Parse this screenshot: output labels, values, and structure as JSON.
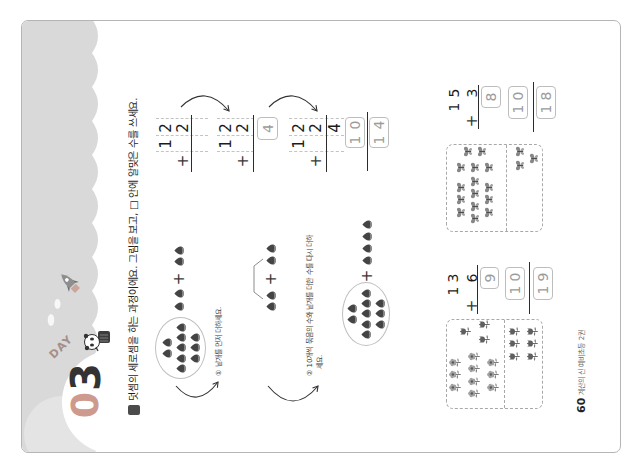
{
  "header": {
    "day_label": "DAY",
    "day_number_first": "0",
    "day_number_second": "3",
    "accent_color": "#cf9a8e",
    "band_color": "#d9d9d9",
    "decorations": [
      "rocket-icon",
      "cloud-icon",
      "astronaut-character"
    ]
  },
  "instruction": {
    "icon": "problem-marker-icon",
    "text": "덧셈의 세로셈을 하는 과정이에요. 그림을 보고, □ 안에 알맞은 수를 쓰세요."
  },
  "example": {
    "pictures": [
      {
        "bundle_rows": [
          2,
          5,
          3
        ],
        "left_count": 2,
        "operator": "+",
        "right_count": 2
      },
      {
        "left_count": 2,
        "operator": "+",
        "right_count": 2
      },
      {
        "bundle_rows": [
          2,
          5,
          3
        ],
        "operator": "+",
        "right_count": 4
      }
    ],
    "steps": [
      {
        "text": "① 낱개를 먼저 더하세요."
      },
      {
        "line1": "② 10개씩 묶음의 수와 낱개를 더한 수를 다시 더하",
        "line2": "세요."
      }
    ],
    "columns": [
      {
        "top_tens": "1",
        "top_ones": "2",
        "operator": "+",
        "bottom_ones": "2"
      },
      {
        "top_tens": "1",
        "top_ones": "2",
        "operator": "+",
        "bottom_ones": "2",
        "ones_box": "4"
      },
      {
        "top_tens": "1",
        "top_ones": "2",
        "operator": "+",
        "bottom_ones": "2",
        "ones_sum": "4",
        "tens_box": "10",
        "result_box": "14"
      }
    ]
  },
  "problems": [
    {
      "top_tens": "1",
      "top_ones": "3",
      "operator": "+",
      "bottom_ones": "6",
      "ones_box": "9",
      "tens_box": "10",
      "result_box": "19",
      "picture": {
        "bundle_item": "flower",
        "bundle_rows": [
          3,
          4,
          3
        ],
        "top_ones_item": "tulip",
        "top_ones_rows": [
          1,
          2
        ],
        "bottom_item": "tulip",
        "bottom_rows": [
          3,
          3
        ]
      }
    },
    {
      "top_tens": "1",
      "top_ones": "5",
      "operator": "+",
      "bottom_ones": "3",
      "ones_box": "8",
      "tens_box": "10",
      "result_box": "18",
      "picture": {
        "bundle_item": "butterfly",
        "bundle_rows": [
          3,
          4,
          3
        ],
        "top_ones_item": "butterfly",
        "top_ones_cols": [
          3,
          2
        ],
        "bottom_item": "butterfly",
        "bottom_rows": [
          2,
          1
        ]
      }
    }
  ],
  "footer": {
    "page_number": "60",
    "book_title": "계산의 신 예비초등 2권"
  }
}
